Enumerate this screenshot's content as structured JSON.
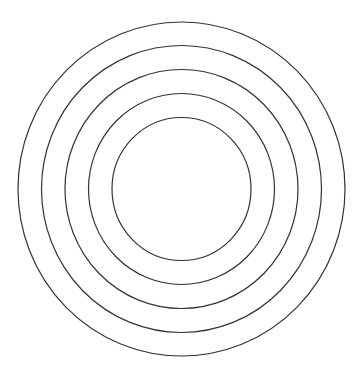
{
  "diagram": {
    "type": "concentric-circles",
    "background": "#ffffff",
    "stroke": "#333333",
    "center": {
      "x": 181.5,
      "y": 189
    },
    "circles": [
      {
        "rx": 163.5,
        "ry": 167
      },
      {
        "rx": 140,
        "ry": 143.5
      },
      {
        "rx": 116.5,
        "ry": 119.5
      },
      {
        "rx": 93,
        "ry": 95.5
      },
      {
        "rx": 69.5,
        "ry": 71.5
      }
    ]
  }
}
